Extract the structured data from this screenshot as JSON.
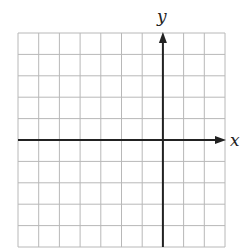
{
  "chart_data": {
    "type": "coordinate-grid",
    "title": "",
    "xlabel": "x",
    "ylabel": "y",
    "grid": true,
    "columns": 10,
    "rows": 10,
    "y_axis_column": 7,
    "x_axis_row": 5,
    "tick_labels": [],
    "colors": {
      "grid": "#b8b8b8",
      "axis": "#222222",
      "background": "#ffffff"
    }
  },
  "labels": {
    "x_axis": "x",
    "y_axis": "y"
  }
}
